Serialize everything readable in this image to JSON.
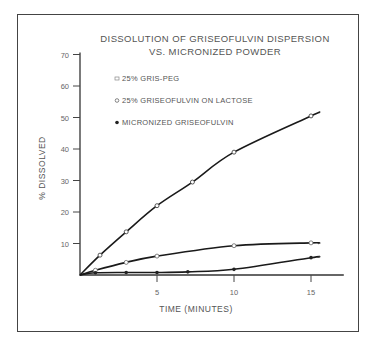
{
  "chart_data": {
    "type": "line",
    "title_lines": [
      "DISSOLUTION OF GRISEOFULVIN DISPERSION",
      "VS. MICRONIZED POWDER"
    ],
    "xlabel": "TIME (MINUTES)",
    "ylabel": "% DISSOLVED",
    "xlim": [
      0,
      17
    ],
    "ylim": [
      0,
      70
    ],
    "x_ticks": [
      5,
      10,
      15
    ],
    "y_ticks": [
      10,
      20,
      30,
      40,
      50,
      60,
      70
    ],
    "grid": false,
    "legend_position": "upper-left",
    "series": [
      {
        "name": "25% GRIS-PEG",
        "marker": "open-square",
        "x": [
          0,
          1.3,
          3,
          5,
          7.3,
          10,
          15,
          15.5
        ],
        "values": [
          0,
          6.3,
          13.7,
          22,
          29.5,
          39,
          50.5,
          51.5
        ]
      },
      {
        "name": "25% GRISEOFULVIN ON LACTOSE",
        "marker": "open-circle",
        "x": [
          0,
          1,
          3,
          5,
          10,
          15,
          15.5
        ],
        "values": [
          0,
          1.5,
          4,
          6,
          9.3,
          10.2,
          10
        ]
      },
      {
        "name": "MICRONIZED GRISEOFULVIN",
        "marker": "filled-circle",
        "x": [
          0,
          1,
          3,
          5,
          7,
          10,
          15,
          15.5
        ],
        "values": [
          0,
          0.7,
          0.8,
          0.8,
          1,
          1.8,
          5.5,
          5.7
        ]
      }
    ]
  }
}
